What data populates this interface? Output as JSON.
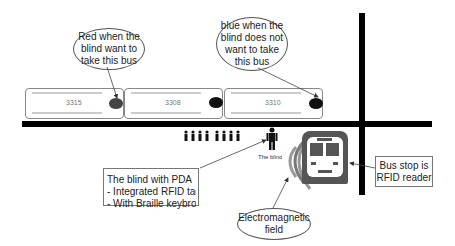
{
  "diagram": {
    "callouts": {
      "red": {
        "lines": [
          "Red when the",
          "blind want to",
          "take this bus"
        ]
      },
      "blue": {
        "lines": [
          "blue when the",
          "blind does not",
          "want to take",
          "this bus"
        ]
      },
      "pda": {
        "lines": [
          "The blind with PDA",
          "- Integrated RFID tag",
          "- With Braille keybroad"
        ]
      },
      "em_field": {
        "lines": [
          "Electromagnetic",
          "field"
        ]
      },
      "bus_stop": {
        "lines": [
          "Bus stop is",
          "RFID reader"
        ]
      }
    },
    "buses": [
      {
        "number": "3315",
        "indicator_color": "#444444"
      },
      {
        "number": "3308",
        "indicator_color": "#111111"
      },
      {
        "number": "3310",
        "indicator_color": "#111111"
      }
    ],
    "blind_label": "The blind",
    "queue_people_count": 8,
    "colors": {
      "road": "#000000",
      "field_arc": "#999999",
      "bus_panel": "#555555"
    }
  }
}
